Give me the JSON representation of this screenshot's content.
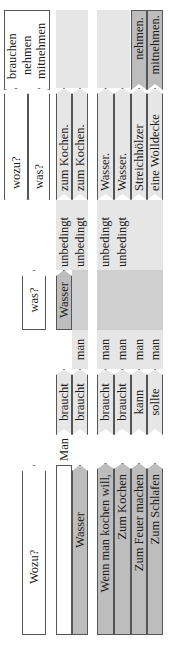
{
  "table": {
    "header": {
      "wozu_q": "Wozu?",
      "was_q": "was?",
      "wozu_small": "wozu?",
      "was_small": "was?",
      "verbs": [
        "brauchen",
        "nehmen",
        "mitnehmen"
      ]
    },
    "example_row": {
      "subject": "Man",
      "verb": "braucht",
      "object": "Wasser",
      "adverb": "unbedingt",
      "purpose": "zum Kochen."
    },
    "inverted_row": {
      "wozu": "Wasser",
      "verb": "braucht",
      "pronoun": "man",
      "adverb": "unbedingt",
      "purpose": "zum Kochen."
    },
    "rows": [
      {
        "wozu": "Wenn man kochen will,",
        "verb": "braucht",
        "pronoun": "man",
        "adverb": "unbedingt",
        "object": "Wasser.",
        "infinitive": ""
      },
      {
        "wozu": "Zum Kochen",
        "verb": "braucht",
        "pronoun": "man",
        "adverb": "unbedingt",
        "object": "Wasser.",
        "infinitive": ""
      },
      {
        "wozu": "Zum Feuer machen",
        "verb": "kann",
        "pronoun": "man",
        "adverb": "",
        "object": "Streichhölzer",
        "infinitive": "nehmen."
      },
      {
        "wozu": "Zum Schlafen",
        "verb": "sollte",
        "pronoun": "man",
        "adverb": "",
        "object": "eine Wolldecke",
        "infinitive": "mitnehmen."
      }
    ]
  },
  "colors": {
    "dark_gray": "#bdbdbd",
    "light_gray": "#e6e6e6",
    "border": "#555555"
  }
}
